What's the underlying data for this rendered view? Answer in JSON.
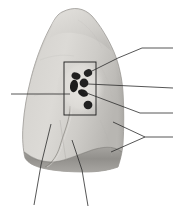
{
  "figure": {
    "background_color": "#ffffff",
    "canvas": {
      "width": 179,
      "height": 212
    }
  },
  "colors": {
    "lung_tissue_light": "#d8d6d2",
    "lung_tissue_mid": "#c6c4c0",
    "lung_tissue_shadow": "#b0aeaa",
    "lung_tissue_dark": "#9b9995",
    "diaphragm_surface": "#8e8c88",
    "hilum_structure_dark": "#1f1f1f",
    "hilum_structure_mid": "#2e2e2e",
    "outline": "#8a8884",
    "leader_line": "#2b2b2b",
    "hilum_box": "#1a1a1a"
  },
  "organ": {
    "name": "lung",
    "apex_label": "",
    "base_label": "",
    "anterior_border_label": "",
    "fissure_label": ""
  },
  "hilum_box": {
    "name": "hilum-region-box",
    "x": 64,
    "y": 62,
    "width": 32,
    "height": 53,
    "stroke_width": 1
  },
  "hilar_structures": [
    {
      "name": "hilar-structure-upper-right",
      "cx": 88,
      "cy": 73,
      "rx": 4.2,
      "ry": 3.6,
      "rotate": -25
    },
    {
      "name": "hilar-structure-upper-left",
      "cx": 76,
      "cy": 76,
      "rx": 4.6,
      "ry": 3.4,
      "rotate": 20
    },
    {
      "name": "hilar-structure-mid-left",
      "cx": 74,
      "cy": 86,
      "rx": 4.0,
      "ry": 6.0,
      "rotate": 10
    },
    {
      "name": "hilar-structure-mid-center",
      "cx": 84,
      "cy": 84,
      "rx": 4.4,
      "ry": 4.4,
      "rotate": 0
    },
    {
      "name": "hilar-structure-mid-right",
      "cx": 83,
      "cy": 92,
      "rx": 5.0,
      "ry": 3.4,
      "rotate": 25
    },
    {
      "name": "hilar-structure-lower",
      "cx": 88,
      "cy": 105,
      "rx": 4.4,
      "ry": 4.2,
      "rotate": 0
    }
  ],
  "leader_lines": [
    {
      "name": "leader-line-1-upper-hilum",
      "label": "",
      "points": "90,72 118,58 142,48 173,48",
      "anchor": {
        "x": 90,
        "y": 72
      },
      "label_end": {
        "x": 173,
        "y": 48
      }
    },
    {
      "name": "leader-line-2-mid-hilum",
      "label": "",
      "points": "88,84 173,88",
      "anchor": {
        "x": 88,
        "y": 84
      },
      "label_end": {
        "x": 173,
        "y": 88
      }
    },
    {
      "name": "leader-line-3-lower-hilum",
      "label": "",
      "points": "84,92 140,113 173,113",
      "anchor": {
        "x": 84,
        "y": 92
      },
      "label_end": {
        "x": 173,
        "y": 113
      }
    },
    {
      "name": "leader-line-4-left-hilum",
      "label": "",
      "points": "11,94 70,94",
      "anchor": {
        "x": 70,
        "y": 94
      },
      "label_end": {
        "x": 11,
        "y": 94
      }
    },
    {
      "name": "leader-line-5-lobe-upper-arm",
      "label": "",
      "points": "113,122 145,137",
      "anchor": {
        "x": 113,
        "y": 122
      },
      "label_end": {
        "x": 145,
        "y": 137
      }
    },
    {
      "name": "leader-line-6-lobe-lower-arm",
      "label": "",
      "points": "111,152 145,137",
      "anchor": {
        "x": 111,
        "y": 152
      },
      "label_end": {
        "x": 145,
        "y": 137
      }
    },
    {
      "name": "leader-line-7-lobe-bracket-stem",
      "label": "",
      "points": "145,137 173,137",
      "anchor": {
        "x": 145,
        "y": 137
      },
      "label_end": {
        "x": 173,
        "y": 137
      }
    },
    {
      "name": "leader-line-8-base-left",
      "label": "",
      "points": "51,124 41,165 34,205",
      "anchor": {
        "x": 51,
        "y": 124
      },
      "label_end": {
        "x": 34,
        "y": 205
      }
    },
    {
      "name": "leader-line-9-base-right",
      "label": "",
      "points": "72,140 82,170 88,206",
      "anchor": {
        "x": 72,
        "y": 140
      },
      "label_end": {
        "x": 88,
        "y": 206
      }
    }
  ],
  "fissure": {
    "name": "oblique-fissure",
    "path": "M 70,106 C 70,120 64,132 60,146 C 57,156 52,163 45,167"
  }
}
